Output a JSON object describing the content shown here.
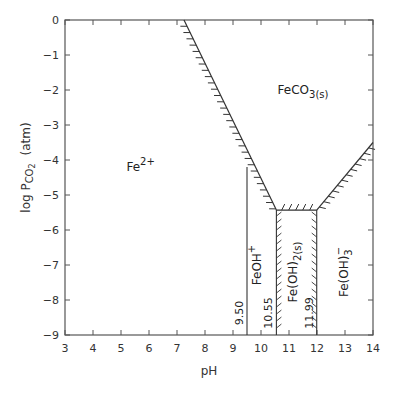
{
  "chart_data": {
    "type": "line",
    "title": "",
    "xlabel": "pH",
    "ylabel": "log P_CO2 (atm)",
    "ylabel_parts": {
      "pre": "log P",
      "sub": "CO",
      "sub2": "2",
      "post": "(atm)"
    },
    "xlim": [
      3,
      14
    ],
    "ylim": [
      -9,
      0
    ],
    "grid": false,
    "x_ticks": [
      "3",
      "4",
      "5",
      "6",
      "7",
      "8",
      "9",
      "10",
      "11",
      "12",
      "13",
      "14"
    ],
    "y_ticks": [
      "0",
      "−1",
      "−2",
      "−3",
      "−4",
      "−5",
      "−6",
      "−7",
      "−8",
      "−9"
    ],
    "series": [
      {
        "name": "FeCO3(s) saturation boundary (left)",
        "points": [
          [
            7.25,
            0
          ],
          [
            9.5,
            -4.2
          ],
          [
            10.55,
            -5.43
          ]
        ]
      },
      {
        "name": "FeCO3(s) saturation boundary (bottom)",
        "points": [
          [
            10.55,
            -5.43
          ],
          [
            11.99,
            -5.43
          ]
        ]
      },
      {
        "name": "FeCO3(s) saturation boundary (right)",
        "points": [
          [
            11.99,
            -5.43
          ],
          [
            14,
            -3.5
          ]
        ]
      },
      {
        "name": "Fe2+/FeOH+ boundary",
        "points": [
          [
            9.5,
            -4.2
          ],
          [
            9.5,
            -9
          ]
        ]
      },
      {
        "name": "FeOH+/Fe(OH)2(s) boundary",
        "points": [
          [
            10.55,
            -5.43
          ],
          [
            10.55,
            -9
          ]
        ]
      },
      {
        "name": "Fe(OH)2(s)/Fe(OH)3- boundary",
        "points": [
          [
            11.99,
            -5.43
          ],
          [
            11.99,
            -9
          ]
        ]
      }
    ],
    "regions": [
      {
        "label": "Fe",
        "sup": "2+",
        "x": 5.7,
        "y": -4.3
      },
      {
        "label": "FeCO",
        "sub": "3(s)",
        "x": 11.5,
        "y": -2.1
      },
      {
        "label": "FeOH",
        "sup": "+",
        "x": 10.0,
        "y": -7.0,
        "rotated": true
      },
      {
        "label": "Fe(OH)",
        "sub": "2(s)",
        "x": 11.27,
        "y": -7.2,
        "rotated": true
      },
      {
        "label": "Fe(OH)",
        "sub": "3",
        "sup": "−",
        "x": 13.1,
        "y": -7.2,
        "rotated": true
      }
    ],
    "annotations": [
      {
        "text": "9.50",
        "x": 9.5
      },
      {
        "text": "10.55",
        "x": 10.55
      },
      {
        "text": "11.99",
        "x": 11.99
      }
    ]
  }
}
